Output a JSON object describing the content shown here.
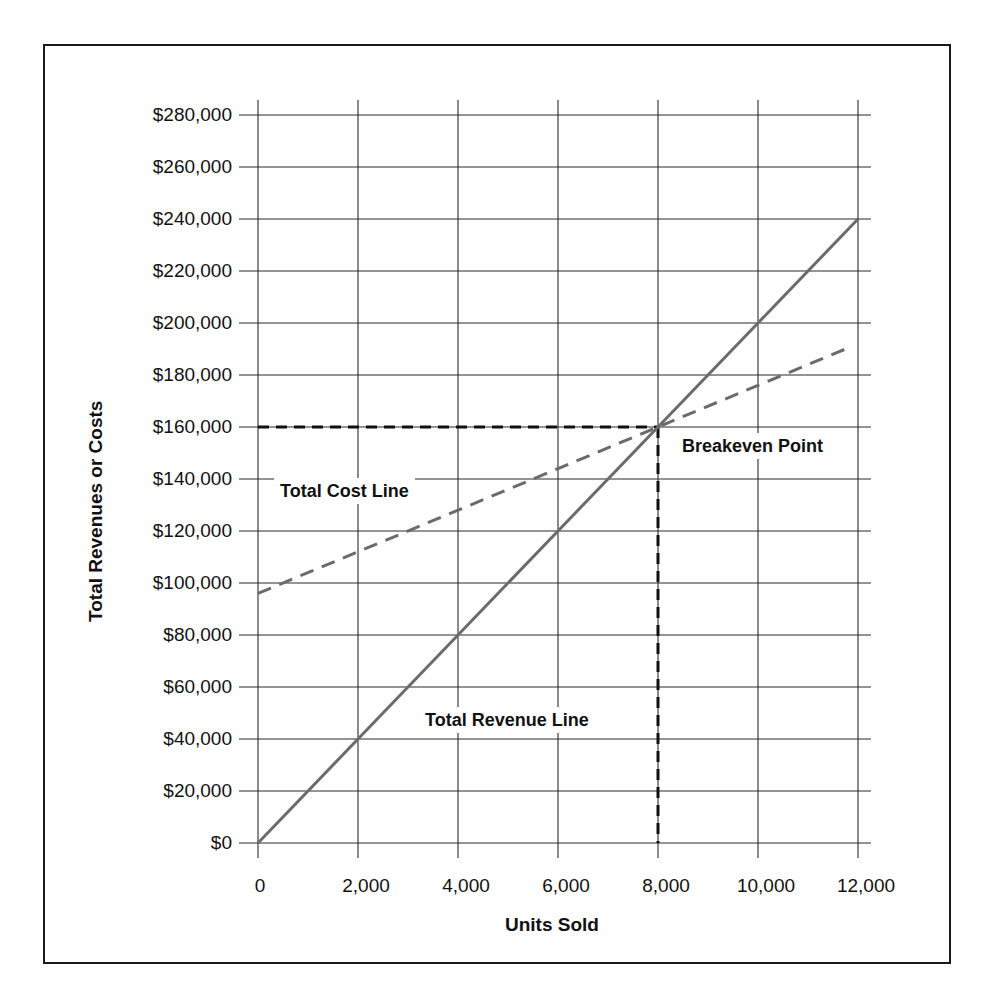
{
  "chart_data": {
    "type": "line",
    "title": "",
    "xlabel": "Units Sold",
    "ylabel": "Total Revenues or Costs",
    "xlim": [
      0,
      12000
    ],
    "ylim": [
      0,
      280000
    ],
    "grid": true,
    "x_ticks": [
      "0",
      "2,000",
      "4,000",
      "6,000",
      "8,000",
      "10,000",
      "12,000"
    ],
    "y_ticks": [
      "$0",
      "$20,000",
      "$40,000",
      "$60,000",
      "$80,000",
      "$100,000",
      "$120,000",
      "$140,000",
      "$160,000",
      "$180,000",
      "$200,000",
      "$220,000",
      "$240,000",
      "$260,000",
      "$280,000"
    ],
    "series": [
      {
        "name": "Total Revenue Line",
        "style": "solid",
        "color": "#6b6b6b",
        "x": [
          0,
          2000,
          4000,
          6000,
          8000,
          10000,
          12000
        ],
        "values": [
          0,
          40000,
          80000,
          120000,
          160000,
          200000,
          240000
        ]
      },
      {
        "name": "Total Cost Line",
        "style": "dashed",
        "color": "#6b6b6b",
        "x": [
          0,
          2000,
          4000,
          6000,
          8000,
          10000,
          11800
        ],
        "values": [
          96000,
          112000,
          128000,
          144000,
          160000,
          176000,
          190400
        ]
      }
    ],
    "annotations": [
      {
        "text": "Breakeven Point",
        "x": 8000,
        "y": 160000,
        "guides": "dashed lines to both axes"
      },
      {
        "text": "Total Cost Line",
        "x": 1500,
        "y": 140000
      },
      {
        "text": "Total Revenue Line",
        "x": 6500,
        "y": 52000
      }
    ],
    "breakeven": {
      "units": 8000,
      "amount": 160000
    }
  },
  "labels": {
    "xlabel": "Units Sold",
    "ylabel": "Total Revenues or Costs",
    "breakeven": "Breakeven Point",
    "cost_line": "Total Cost Line",
    "revenue_line": "Total Revenue Line"
  },
  "colors": {
    "gridline": "#2b2b2b",
    "series_line": "#6b6b6b",
    "guide_line": "#111111"
  }
}
